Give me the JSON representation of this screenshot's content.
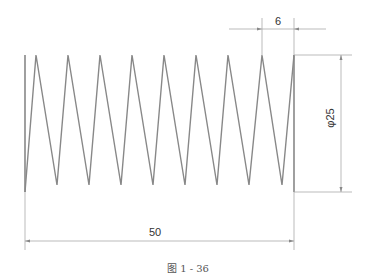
{
  "figure": {
    "caption": "图 1 - 36"
  },
  "dimensions": {
    "pitch": {
      "label": "6",
      "value": 6
    },
    "length": {
      "label": "50",
      "value": 50
    },
    "diameter": {
      "label": "φ25",
      "value": 25
    }
  },
  "spring": {
    "coils_peaks": 9,
    "coils_valleys": 8,
    "stroke_color": "#888888"
  },
  "colors": {
    "line": "#888888",
    "dim_line": "#999999",
    "text": "#333333",
    "background": "#ffffff"
  }
}
